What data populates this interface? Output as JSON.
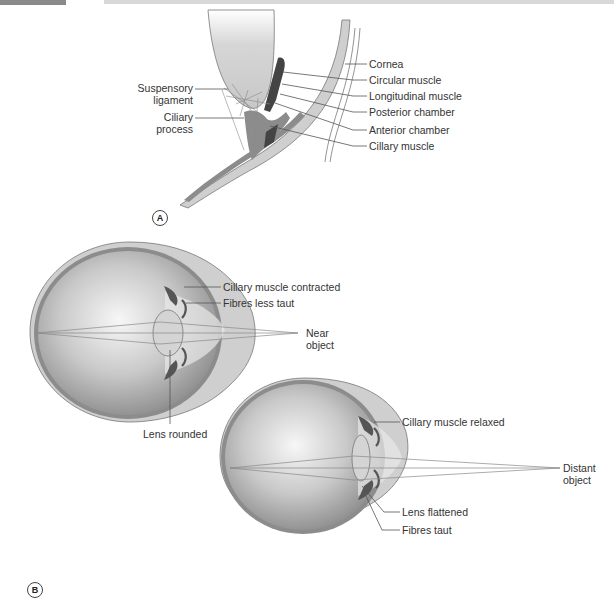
{
  "panel_a": {
    "badge": "A",
    "labels_left": {
      "suspensory_ligament": [
        "Suspensory",
        "ligament"
      ],
      "ciliary_process": [
        "Ciliary",
        "process"
      ]
    },
    "labels_right": [
      "Cornea",
      "Circular muscle",
      "Longitudinal muscle",
      "Posterior chamber",
      "Anterior chamber",
      "Cillary muscle"
    ]
  },
  "panel_b": {
    "badge": "B",
    "near_eye": {
      "labels": {
        "muscle": "Cillary muscle contracted",
        "fibres": "Fibres less taut",
        "object": [
          "Near",
          "object"
        ],
        "lens": "Lens rounded"
      }
    },
    "distant_eye": {
      "labels": {
        "muscle": "Cillary muscle relaxed",
        "object": [
          "Distant",
          "object"
        ],
        "lens": "Lens flattened",
        "fibres": "Fibres taut"
      }
    }
  },
  "colors": {
    "sclera": "#cfcfcf",
    "choroid": "#8c8c8c",
    "vitreous_center": "#f4f4f4",
    "vitreous_edge": "#9a9a9a",
    "muscle": "#4a4a4a",
    "lens": "#d4d4d4",
    "leader_line": "#555555"
  }
}
